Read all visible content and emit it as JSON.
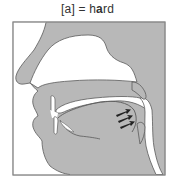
{
  "caption": {
    "symbol": "[a]",
    "equals": " = ",
    "word_prefix": "h",
    "word_vowel": "a",
    "word_suffix": "rd"
  },
  "diagram": {
    "type": "midsagittal vocal tract section",
    "parts": [
      "nasal cavity",
      "hard palate",
      "velum",
      "upper lip",
      "upper teeth",
      "lower lip",
      "lower teeth",
      "tongue",
      "pharynx",
      "epiglottis",
      "jaw"
    ],
    "annotation": "three arrows indicating tongue retraction toward pharynx",
    "arrow_count": 3,
    "colors": {
      "tissue": "#b8b8b8",
      "outline": "#5a5a5a",
      "cavity": "#ffffff",
      "frame": "#8a8a8a",
      "arrow": "#222222"
    }
  }
}
